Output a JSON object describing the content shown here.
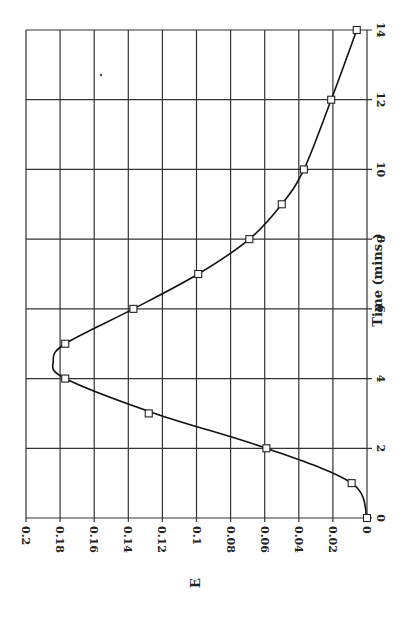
{
  "chart_data": {
    "type": "line",
    "title": "",
    "xlabel": "Time (mins.)",
    "ylabel": "E",
    "orientation": "rotated 90° clockwise on page (Time axis vertical at right, E axis horizontal at bottom)",
    "x": [
      0,
      1,
      2,
      3,
      4,
      5,
      6,
      7,
      8,
      9,
      10,
      12,
      14
    ],
    "series": [
      {
        "name": "E(t)",
        "marker": "open-square",
        "smoothed_line": true,
        "values": [
          0,
          0.009,
          0.059,
          0.128,
          0.177,
          0.177,
          0.137,
          0.099,
          0.069,
          0.05,
          0.037,
          0.021,
          0.006
        ]
      }
    ],
    "xlim": [
      0,
      14
    ],
    "ylim": [
      0,
      0.2
    ],
    "x_ticks": [
      "0",
      "2",
      "4",
      "6",
      "8",
      "10",
      "12",
      "14"
    ],
    "y_ticks": [
      "0",
      "0.02",
      "0.04",
      "0.06",
      "0.08",
      "0.1",
      "0.12",
      "0.14",
      "0.16",
      "0.18",
      "0.2"
    ],
    "grid": true,
    "legend": null,
    "peak_annotation_estimate": {
      "time": 4.5,
      "E": 0.184
    }
  },
  "labels": {
    "x_axis_title": "Time (mins.)",
    "y_axis_title": "E"
  }
}
